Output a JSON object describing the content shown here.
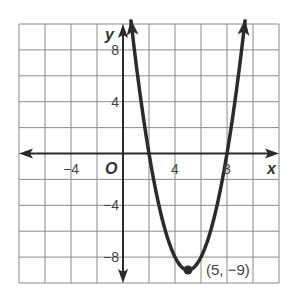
{
  "chart_data": {
    "type": "line",
    "title": "",
    "xlabel": "x",
    "ylabel": "y",
    "origin_label": "O",
    "xlim": [
      -8,
      12
    ],
    "ylim": [
      -10,
      10
    ],
    "grid": true,
    "grid_step": 2,
    "x_ticks": [
      {
        "value": -4,
        "label": "−4"
      },
      {
        "value": 4,
        "label": "4"
      },
      {
        "value": 8,
        "label": "8"
      }
    ],
    "y_ticks": [
      {
        "value": 8,
        "label": "8"
      },
      {
        "value": 4,
        "label": "4"
      },
      {
        "value": -4,
        "label": "−4"
      },
      {
        "value": -8,
        "label": "−8"
      }
    ],
    "series": [
      {
        "name": "y = (x − 5)² − 9",
        "function": {
          "a": 1,
          "h": 5,
          "k": -9
        },
        "x_range": [
          0.6,
          9.4
        ],
        "color": "#2b2b2b"
      }
    ],
    "annotations": [
      {
        "x": 5,
        "y": -9,
        "label": "(5, −9)",
        "marker": "point"
      }
    ]
  }
}
